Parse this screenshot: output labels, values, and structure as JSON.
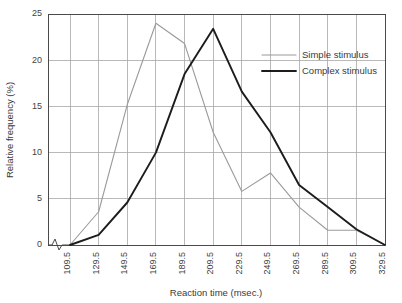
{
  "chart_data": {
    "type": "line",
    "title": "",
    "xlabel": "Reaction time (msec.)",
    "ylabel": "Relative frequency (%)",
    "categories": [
      "109.5",
      "129.5",
      "149.5",
      "169.5",
      "189.5",
      "209.5",
      "229.5",
      "249.5",
      "269.5",
      "289.5",
      "309.5",
      "329.5"
    ],
    "x": [
      109.5,
      129.5,
      149.5,
      169.5,
      189.5,
      209.5,
      229.5,
      249.5,
      269.5,
      289.5,
      309.5,
      329.5
    ],
    "series": [
      {
        "name": "Simple stimulus",
        "color": "#9a9a9a",
        "values": [
          0,
          3.6,
          15.2,
          24.0,
          21.8,
          12.2,
          5.8,
          7.8,
          4.1,
          1.6,
          1.6,
          0
        ]
      },
      {
        "name": "Complex stimulus",
        "color": "#1c1c1c",
        "values": [
          0,
          1.1,
          4.6,
          10.0,
          18.5,
          23.4,
          16.6,
          12.2,
          6.5,
          4.1,
          1.7,
          0
        ]
      }
    ],
    "ylim": [
      0,
      25
    ],
    "yticks": [
      0,
      5,
      10,
      15,
      20,
      25
    ],
    "ytick_labels": [
      "0",
      "5",
      "10",
      "15",
      "20",
      "25"
    ],
    "grid": true,
    "grid_x": true,
    "grid_y": true,
    "legend_position": "upper right",
    "axis_break": true
  },
  "legend": {
    "entries": [
      {
        "label": "Simple stimulus"
      },
      {
        "label": "Complex stimulus"
      }
    ]
  },
  "axes": {
    "x_title": "Reaction time (msec.)",
    "y_title": "Relative frequency (%)"
  }
}
